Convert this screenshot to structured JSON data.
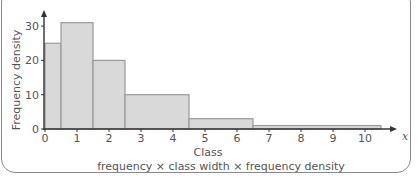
{
  "chart_data": {
    "type": "bar",
    "subtype": "histogram",
    "xlabel": "Class",
    "ylabel": "Frequency density",
    "x_axis_var": "x",
    "caption": "frequency × class width × frequency density",
    "bins": [
      {
        "from": 0,
        "to": 0.5,
        "density": 25
      },
      {
        "from": 0.5,
        "to": 1.5,
        "density": 31
      },
      {
        "from": 1.5,
        "to": 2.5,
        "density": 20
      },
      {
        "from": 2.5,
        "to": 4.5,
        "density": 10
      },
      {
        "from": 4.5,
        "to": 6.5,
        "density": 3
      },
      {
        "from": 6.5,
        "to": 10.5,
        "density": 1
      }
    ],
    "categories": [
      "0–0.5",
      "0.5–1.5",
      "1.5–2.5",
      "2.5–4.5",
      "4.5–6.5",
      "6.5–10.5"
    ],
    "values": [
      25,
      31,
      20,
      10,
      3,
      1
    ],
    "x_ticks": [
      "0",
      "1",
      "2",
      "3",
      "4",
      "5",
      "6",
      "7",
      "8",
      "9",
      "10"
    ],
    "y_ticks": [
      "0",
      "10",
      "20",
      "30"
    ],
    "xlim": [
      0,
      10.8
    ],
    "ylim": [
      0,
      32
    ],
    "grid": false,
    "bar_fill": "#d9d9d9",
    "bar_stroke": "#9a9a9a"
  }
}
